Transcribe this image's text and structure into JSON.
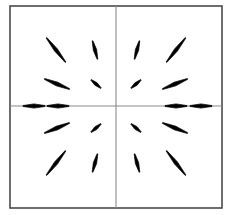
{
  "figure": {
    "title": "",
    "background_color": "#ffffff",
    "width": 231,
    "height": 215
  },
  "frame": {
    "name": "plot-frame",
    "x": 10,
    "y": 6,
    "width": 212,
    "height": 202,
    "stroke_color": "#4a4a4a",
    "stroke_width": 1.6,
    "fill": "#ffffff"
  },
  "axes": {
    "stroke_color": "#8a8a8a",
    "stroke_width": 1.1,
    "horizontal": {
      "name": "x-axis-line",
      "y": 106,
      "x_start": 10,
      "x_end": 222
    },
    "vertical": {
      "name": "y-axis-line",
      "x": 116,
      "y_start": 6,
      "y_end": 208
    },
    "origin": {
      "x": 116,
      "y": 106
    }
  },
  "chart_data": {
    "type": "scatter",
    "title": "",
    "subtitle": "",
    "xlabel": "",
    "ylabel": "",
    "xlim": [
      -4,
      4
    ],
    "ylim": [
      -4,
      4
    ],
    "grid": false,
    "legend": null,
    "glyph": "line-segment",
    "segment_color": "#000000",
    "segments": [
      {
        "id": "seg-tl-outer-far",
        "cx": 56,
        "cy": 50,
        "length": 31,
        "angle_deg": 52,
        "thickness": 3.6
      },
      {
        "id": "seg-tl-outer-near",
        "cx": 95,
        "cy": 50,
        "length": 19,
        "angle_deg": 75,
        "thickness": 3.4
      },
      {
        "id": "seg-tr-outer-near",
        "cx": 137,
        "cy": 50,
        "length": 19,
        "angle_deg": 105,
        "thickness": 3.4
      },
      {
        "id": "seg-tr-outer-far",
        "cx": 176,
        "cy": 50,
        "length": 31,
        "angle_deg": 128,
        "thickness": 3.6
      },
      {
        "id": "seg-tl-inner-far",
        "cx": 57,
        "cy": 84,
        "length": 27,
        "angle_deg": 22,
        "thickness": 4.0
      },
      {
        "id": "seg-tl-inner-near",
        "cx": 96,
        "cy": 84,
        "length": 13,
        "angle_deg": 40,
        "thickness": 3.4
      },
      {
        "id": "seg-tr-inner-near",
        "cx": 136,
        "cy": 84,
        "length": 13,
        "angle_deg": 140,
        "thickness": 3.4
      },
      {
        "id": "seg-tr-inner-far",
        "cx": 175,
        "cy": 84,
        "length": 27,
        "angle_deg": 158,
        "thickness": 4.0
      },
      {
        "id": "seg-axis-left-far",
        "cx": 34,
        "cy": 106,
        "length": 22,
        "angle_deg": 0,
        "thickness": 4.2
      },
      {
        "id": "seg-axis-left-near",
        "cx": 58,
        "cy": 106,
        "length": 22,
        "angle_deg": 0,
        "thickness": 4.2
      },
      {
        "id": "seg-axis-right-near",
        "cx": 176,
        "cy": 106,
        "length": 22,
        "angle_deg": 0,
        "thickness": 4.2
      },
      {
        "id": "seg-axis-right-far",
        "cx": 201,
        "cy": 106,
        "length": 22,
        "angle_deg": 0,
        "thickness": 4.2
      },
      {
        "id": "seg-bl-inner-far",
        "cx": 57,
        "cy": 128,
        "length": 27,
        "angle_deg": 158,
        "thickness": 4.0
      },
      {
        "id": "seg-bl-inner-near",
        "cx": 96,
        "cy": 128,
        "length": 13,
        "angle_deg": 140,
        "thickness": 3.4
      },
      {
        "id": "seg-br-inner-near",
        "cx": 136,
        "cy": 128,
        "length": 13,
        "angle_deg": 40,
        "thickness": 3.4
      },
      {
        "id": "seg-br-inner-far",
        "cx": 175,
        "cy": 128,
        "length": 27,
        "angle_deg": 22,
        "thickness": 4.0
      },
      {
        "id": "seg-bl-outer-far",
        "cx": 56,
        "cy": 163,
        "length": 31,
        "angle_deg": 128,
        "thickness": 3.6
      },
      {
        "id": "seg-bl-outer-near",
        "cx": 95,
        "cy": 163,
        "length": 19,
        "angle_deg": 105,
        "thickness": 3.4
      },
      {
        "id": "seg-br-outer-near",
        "cx": 137,
        "cy": 163,
        "length": 19,
        "angle_deg": 75,
        "thickness": 3.4
      },
      {
        "id": "seg-br-outer-far",
        "cx": 176,
        "cy": 163,
        "length": 31,
        "angle_deg": 52,
        "thickness": 3.6
      }
    ]
  }
}
